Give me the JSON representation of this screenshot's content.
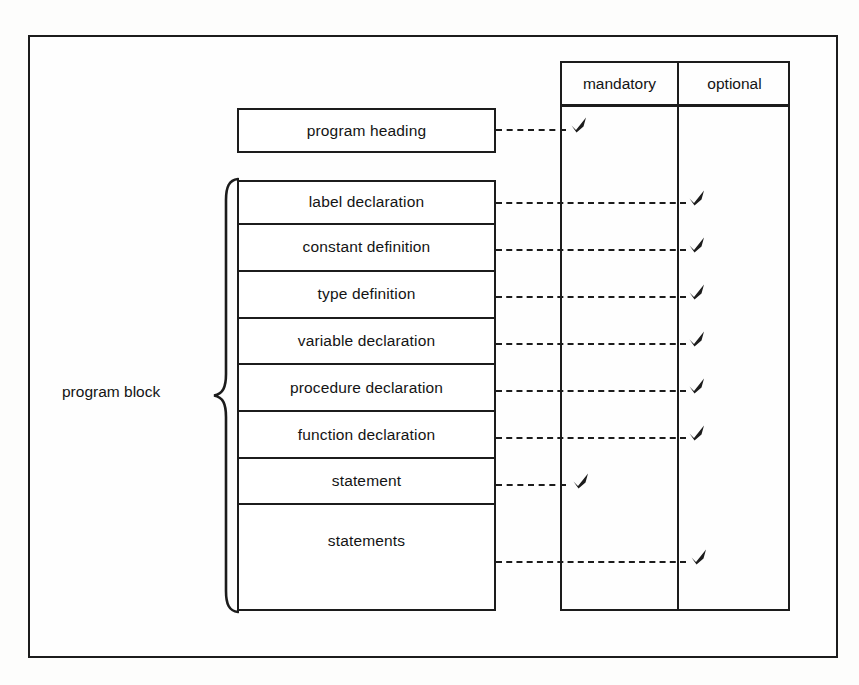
{
  "figure": {
    "page_top_cropped_text": "",
    "left_group": {
      "brace_label": "program block"
    },
    "heading_box": {
      "label": "program heading",
      "requirement": "mandatory"
    },
    "table": {
      "columns": [
        {
          "id": "mandatory",
          "label": "mandatory"
        },
        {
          "id": "optional",
          "label": "optional"
        }
      ]
    },
    "rows": [
      {
        "label": "label declaration",
        "requirement": "optional"
      },
      {
        "label": "constant definition",
        "requirement": "optional"
      },
      {
        "label": "type definition",
        "requirement": "optional"
      },
      {
        "label": "variable declaration",
        "requirement": "optional"
      },
      {
        "label": "procedure declaration",
        "requirement": "optional"
      },
      {
        "label": "function declaration",
        "requirement": "optional"
      },
      {
        "label": "statement",
        "requirement": "mandatory"
      },
      {
        "label": "statements",
        "requirement": "optional"
      }
    ],
    "colors": {
      "ink": "#1c1c1c",
      "paper": "#fefefe"
    }
  }
}
